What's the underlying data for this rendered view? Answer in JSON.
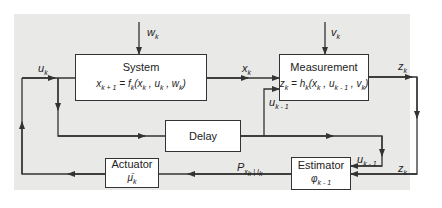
{
  "diagram": {
    "type": "block-diagram",
    "background_color": "#e9e9e7",
    "line_color": "#333333"
  },
  "blocks": {
    "system": {
      "title": "System",
      "equation": "x_{k+1} = f_k(x_k, u_k, w_k)"
    },
    "measurement": {
      "title": "Measurement",
      "equation": "z_k = h_k(x_k, u_{k-1}, v_k)"
    },
    "delay": {
      "title": "Delay"
    },
    "actuator": {
      "title": "Actuator",
      "symbol": "μ̄_k"
    },
    "estimator": {
      "title": "Estimator",
      "symbol": "φ_{k-1}"
    }
  },
  "signals": {
    "w": "w_k",
    "v": "v_k",
    "u": "u_k",
    "x": "x_k",
    "z_out": "z_k",
    "z_in": "z_k",
    "u_prev_meas": "u_{k-1}",
    "u_prev_est": "u_{k-1}",
    "p": "P_{x_k|I_k}"
  }
}
